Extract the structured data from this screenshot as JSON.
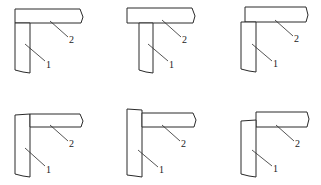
{
  "diagram": {
    "legend": {
      "part_1": "1",
      "part_2": "2"
    },
    "panels": [
      {
        "id": "a",
        "label_1": "1",
        "label_2": "2",
        "joint": "horizontal member overlaps top of vertical member, flush outer edge"
      },
      {
        "id": "b",
        "label_1": "1",
        "label_2": "2",
        "joint": "horizontal member overlaps vertical member, overhangs left"
      },
      {
        "id": "c",
        "label_1": "1",
        "label_2": "2",
        "joint": "vertical member offset left, horizontal member raised"
      },
      {
        "id": "d",
        "label_1": "1",
        "label_2": "2",
        "joint": "vertical member runs full height, horizontal butts against side"
      },
      {
        "id": "e",
        "label_1": "1",
        "label_2": "2",
        "joint": "vertical member extends above horizontal member"
      },
      {
        "id": "f",
        "label_1": "1",
        "label_2": "2",
        "joint": "horizontal member raised above vertical member top"
      }
    ]
  }
}
